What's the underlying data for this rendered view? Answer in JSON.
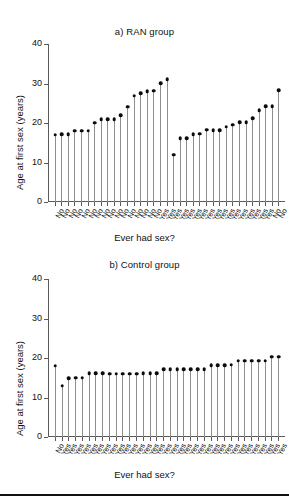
{
  "figure": {
    "width": 289,
    "height": 503,
    "background": "#ffffff",
    "marker_color": "#0b0b0b",
    "stem_color": "#8e8e8e",
    "axis_color": "#5a5a5a",
    "footer_rule": true
  },
  "chart_data": [
    {
      "type": "scatter",
      "title": "a) RAN group",
      "xlabel": "Ever had sex?",
      "ylabel": "Age at first sex (years)",
      "ylim": [
        0,
        40
      ],
      "yticks": [
        0,
        10,
        20,
        30,
        40
      ],
      "ytick_labels": [
        "0",
        "10",
        "20",
        "30",
        "40"
      ],
      "grid": false,
      "legend": "none",
      "style": "stem-and-dot",
      "categories": [
        "No",
        "No",
        "No",
        "No",
        "No",
        "No",
        "No",
        "No",
        "No",
        "No",
        "No",
        "No",
        "No",
        "No",
        "No",
        "No",
        "Yes",
        "Yes",
        "Yes",
        "Yes",
        "Yes",
        "Yes",
        "Yes",
        "Yes",
        "Yes",
        "Yes",
        "Yes",
        "Yes",
        "Yes",
        "Yes",
        "Yes",
        "Yes",
        "Yes"
      ],
      "values": [
        17.0,
        17.1,
        17.1,
        18.0,
        18.1,
        18.1,
        20.1,
        20.9,
        21.0,
        21.0,
        22.0,
        24.1,
        26.9,
        27.6,
        28.0,
        28.2,
        30.1,
        31.1,
        12.0,
        16.1,
        16.2,
        17.2,
        17.3,
        18.3,
        18.2,
        18.2,
        19.1,
        19.6,
        20.2,
        20.2,
        21.2,
        23.2,
        24.2,
        24.2,
        28.3
      ],
      "n_points": 35
    },
    {
      "type": "scatter",
      "title": "b) Control group",
      "xlabel": "Ever had sex?",
      "ylabel": "Age at first sex (years)",
      "ylim": [
        0,
        40
      ],
      "yticks": [
        0,
        10,
        20,
        30,
        40
      ],
      "ytick_labels": [
        "0",
        "10",
        "20",
        "30",
        "40"
      ],
      "grid": false,
      "legend": "none",
      "style": "stem-and-dot",
      "categories": [
        "No",
        "Yes",
        "Yes",
        "Yes",
        "Yes",
        "Yes",
        "Yes",
        "Yes",
        "Yes",
        "Yes",
        "Yes",
        "Yes",
        "Yes",
        "Yes",
        "Yes",
        "Yes",
        "Yes",
        "Yes",
        "Yes",
        "Yes",
        "Yes",
        "Yes",
        "Yes",
        "Yes",
        "Yes",
        "Yes",
        "Yes",
        "Yes",
        "Yes",
        "Yes",
        "Yes",
        "Yes",
        "Yes",
        "Yes"
      ],
      "values": [
        18.1,
        13.0,
        14.9,
        15.0,
        15.0,
        16.1,
        16.1,
        16.1,
        16.0,
        16.0,
        16.0,
        16.0,
        16.0,
        16.1,
        16.1,
        16.2,
        17.1,
        17.1,
        17.2,
        17.2,
        17.2,
        17.1,
        17.2,
        18.2,
        18.2,
        18.2,
        18.3,
        19.3,
        19.3,
        19.3,
        19.3,
        19.3,
        20.3,
        20.3
      ],
      "n_points": 34
    }
  ]
}
